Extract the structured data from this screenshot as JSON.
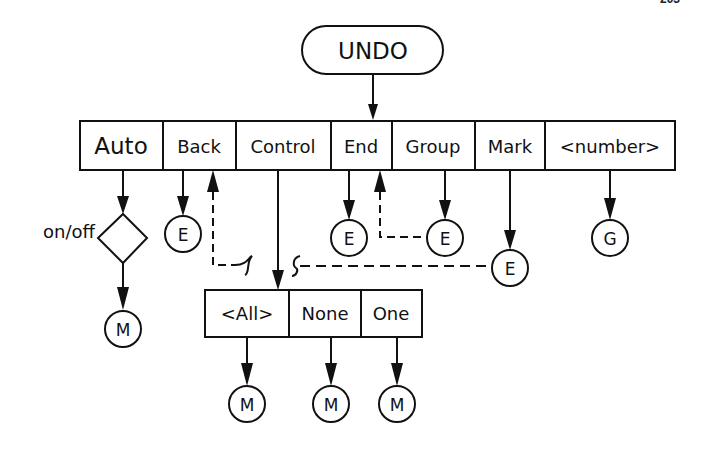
{
  "page_number": "203",
  "root": {
    "label": "UNDO"
  },
  "menu": {
    "items": [
      {
        "label": "Auto"
      },
      {
        "label": "Back"
      },
      {
        "label": "Control"
      },
      {
        "label": "End"
      },
      {
        "label": "Group"
      },
      {
        "label": "Mark"
      },
      {
        "label": "<number>"
      }
    ]
  },
  "auto_branch": {
    "decision_label": "on/off",
    "terminal": "M"
  },
  "terminals": {
    "back": "E",
    "end": "E",
    "group": "E",
    "mark": "E",
    "number": "G"
  },
  "submenu": {
    "items": [
      {
        "label": "<All>",
        "terminal": "M"
      },
      {
        "label": "None",
        "terminal": "M"
      },
      {
        "label": "One",
        "terminal": "M"
      }
    ]
  },
  "colors": {
    "ink": "#111111",
    "background": "#ffffff"
  }
}
